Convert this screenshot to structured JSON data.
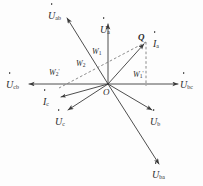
{
  "figure": {
    "type": "phasor-diagram",
    "title": "",
    "origin_label": "O",
    "point_label": "Q",
    "stroke_color": "#3a3a3a",
    "text_color": "#2b2b2b",
    "background": "#fdfdfd"
  },
  "phasors": [
    {
      "id": "u-ab",
      "symbol": "U",
      "sub": "ab",
      "prime": "",
      "label": "U̇ab",
      "angle_deg": 118,
      "length": 86,
      "style": "solid"
    },
    {
      "id": "u-a",
      "symbol": "U",
      "sub": "a",
      "prime": "",
      "label": "U̇a",
      "angle_deg": 90,
      "length": 62,
      "style": "solid"
    },
    {
      "id": "i-a",
      "symbol": "I",
      "sub": "a",
      "prime": "",
      "label": "İa",
      "angle_deg": 46,
      "length": 60,
      "style": "solid"
    },
    {
      "id": "u-bc",
      "symbol": "U",
      "sub": "bc",
      "prime": "",
      "label": "U̇bc",
      "angle_deg": 0,
      "length": 72,
      "style": "solid"
    },
    {
      "id": "u-cb",
      "symbol": "U",
      "sub": "cb",
      "prime": "",
      "label": "U̇cb",
      "angle_deg": 180,
      "length": 80,
      "style": "solid"
    },
    {
      "id": "i-c",
      "symbol": "I",
      "sub": "c",
      "prime": "",
      "label": "İc",
      "angle_deg": 196,
      "length": 52,
      "style": "solid"
    },
    {
      "id": "u-c",
      "symbol": "U",
      "sub": "c",
      "prime": "",
      "label": "U̇c",
      "angle_deg": 215,
      "length": 46,
      "style": "solid"
    },
    {
      "id": "u-b",
      "symbol": "U",
      "sub": "b",
      "prime": "",
      "label": "U̇b",
      "angle_deg": 330,
      "length": 50,
      "style": "solid"
    },
    {
      "id": "u-ba",
      "symbol": "U",
      "sub": "ba",
      "prime": "",
      "label": "U̇ba",
      "angle_deg": 297,
      "length": 88,
      "style": "solid"
    }
  ],
  "angle_labels": [
    {
      "id": "w1",
      "symbol": "W",
      "sub": "1",
      "prime": "",
      "text": "W1"
    },
    {
      "id": "w2",
      "symbol": "W",
      "sub": "2",
      "prime": "",
      "text": "W2"
    },
    {
      "id": "w1-prime",
      "symbol": "W",
      "sub": "1",
      "prime": "'",
      "text": "W1'"
    },
    {
      "id": "w2-prime",
      "symbol": "W",
      "sub": "2",
      "prime": "'",
      "text": "W2'"
    }
  ],
  "points": {
    "origin": {
      "label": "O",
      "x": 108,
      "y": 84
    },
    "q": {
      "label": "Q",
      "x": 146,
      "y": 40
    }
  },
  "guides": [
    {
      "id": "q-vertical-dashed",
      "style": "dashed",
      "from": "Q",
      "to": "horizontal-axis"
    },
    {
      "id": "qo-dashed",
      "style": "dashed",
      "from": "Q",
      "to": "lower-left"
    }
  ]
}
